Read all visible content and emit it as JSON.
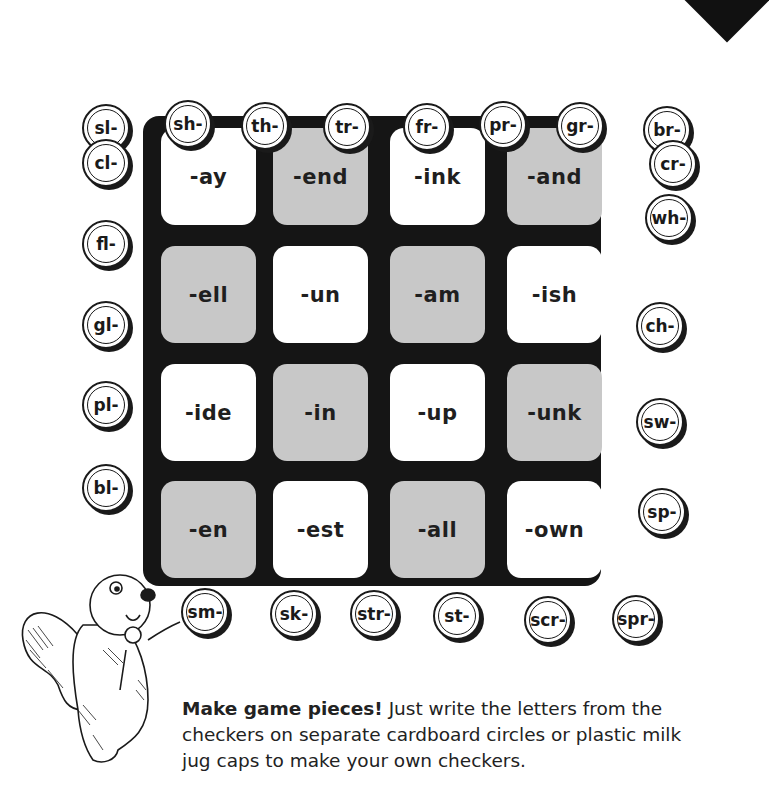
{
  "board": {
    "cells": [
      [
        "-ay",
        "-end",
        "-ink",
        "-and"
      ],
      [
        "-ell",
        "-un",
        "-am",
        "-ish"
      ],
      [
        "-ide",
        "-in",
        "-up",
        "-unk"
      ],
      [
        "-en",
        "-est",
        "-all",
        "-own"
      ]
    ],
    "colors": {
      "frame": "#151515",
      "light": "#ffffff",
      "dark": "#c8c8c8"
    }
  },
  "checkers": {
    "top": [
      "sl-",
      "sh-",
      "th-",
      "tr-",
      "fr-",
      "pr-",
      "gr-",
      "br-"
    ],
    "left": [
      "cl-",
      "fl-",
      "gl-",
      "pl-",
      "bl-"
    ],
    "right": [
      "cr-",
      "wh-",
      "ch-",
      "sw-",
      "sp-"
    ],
    "bottom": [
      "sm-",
      "sk-",
      "str-",
      "st-",
      "scr-",
      "spr-"
    ]
  },
  "caption": {
    "bold": "Make game pieces!",
    "text": " Just write the letters from the checkers on separate cardboard circles or plastic milk jug caps to make your own checkers."
  },
  "illustration": {
    "name": "skunk holding flower"
  }
}
